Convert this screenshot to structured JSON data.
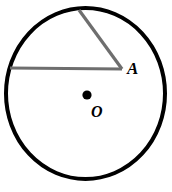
{
  "figure": {
    "name": "circle-with-central-angle",
    "background_color": "#ffffff",
    "labels": {
      "center_point": "O",
      "angle_vertex": "A"
    },
    "colors": {
      "circle_stroke": "#000000",
      "ray_stroke": "#6e6e6e",
      "center_dot_fill": "#000000",
      "label_text": "#000000"
    },
    "circle": {
      "center_x": 85.5,
      "center_y": 93.5,
      "radius_x": 79.5,
      "radius_y": 85.5,
      "stroke_width": 4
    },
    "center_dot": {
      "x": 87,
      "y": 95,
      "radius": 4.6
    },
    "angle": {
      "vertex_x": 122,
      "vertex_y": 69,
      "ray_horizontal_end_x": 10,
      "ray_horizontal_end_y": 68,
      "ray_diagonal_end_x": 79,
      "ray_diagonal_end_y": 10,
      "stroke_width": 3.2
    }
  }
}
